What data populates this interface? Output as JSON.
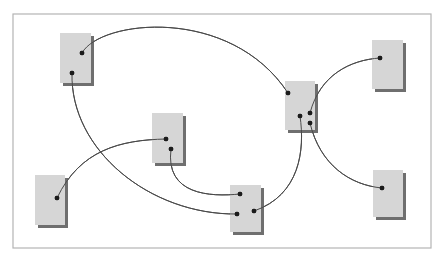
{
  "canvas": {
    "width": 441,
    "height": 261,
    "background": "#ffffff"
  },
  "frame": {
    "x": 13,
    "y": 14,
    "width": 418,
    "height": 234,
    "stroke": "#b4b4b4"
  },
  "colors": {
    "node_fill": "#d6d6d6",
    "node_shadow": "#6f6f6f",
    "edge": "#4a4a4a",
    "port": "#1c1c1c"
  },
  "nodes": [
    {
      "id": "A",
      "x": 60,
      "y": 33,
      "w": 31,
      "h": 50,
      "ports": [
        {
          "id": "A1",
          "x": 82,
          "y": 53
        },
        {
          "id": "A2",
          "x": 72,
          "y": 73
        }
      ]
    },
    {
      "id": "B",
      "x": 152,
      "y": 113,
      "w": 31,
      "h": 50,
      "ports": [
        {
          "id": "B1",
          "x": 166,
          "y": 139
        },
        {
          "id": "B2",
          "x": 171,
          "y": 149
        }
      ]
    },
    {
      "id": "C",
      "x": 285,
      "y": 81,
      "w": 30,
      "h": 49,
      "ports": [
        {
          "id": "C1",
          "x": 288,
          "y": 93
        },
        {
          "id": "C2",
          "x": 300,
          "y": 116
        },
        {
          "id": "C3",
          "x": 310,
          "y": 113
        },
        {
          "id": "C4",
          "x": 310,
          "y": 123
        }
      ]
    },
    {
      "id": "D",
      "x": 35,
      "y": 175,
      "w": 30,
      "h": 50,
      "ports": [
        {
          "id": "D1",
          "x": 57,
          "y": 198
        }
      ]
    },
    {
      "id": "E",
      "x": 230,
      "y": 185,
      "w": 31,
      "h": 47,
      "ports": [
        {
          "id": "E1",
          "x": 240,
          "y": 194
        },
        {
          "id": "E2",
          "x": 237,
          "y": 214
        },
        {
          "id": "E3",
          "x": 254,
          "y": 211
        }
      ]
    },
    {
      "id": "F",
      "x": 372,
      "y": 40,
      "w": 31,
      "h": 49,
      "ports": [
        {
          "id": "F1",
          "x": 380,
          "y": 58
        }
      ]
    },
    {
      "id": "G",
      "x": 373,
      "y": 170,
      "w": 30,
      "h": 47,
      "ports": [
        {
          "id": "G1",
          "x": 382,
          "y": 188
        }
      ]
    }
  ],
  "edges": [
    {
      "from": "A1",
      "to": "C1",
      "path": "M82,53 C100,20 230,5 288,93"
    },
    {
      "from": "A2",
      "to": "E2",
      "path": "M72,73 C70,150 150,215 237,214"
    },
    {
      "from": "D1",
      "to": "B1",
      "path": "M57,198 C80,150 120,140 166,139"
    },
    {
      "from": "B2",
      "to": "E1",
      "path": "M171,149 C165,195 210,197 240,194"
    },
    {
      "from": "E3",
      "to": "C2",
      "path": "M254,211 C300,195 305,150 300,116"
    },
    {
      "from": "C3",
      "to": "F1",
      "path": "M310,113 C320,75 350,60 380,58"
    },
    {
      "from": "C4",
      "to": "G1",
      "path": "M310,123 C320,165 350,185 382,188"
    }
  ]
}
